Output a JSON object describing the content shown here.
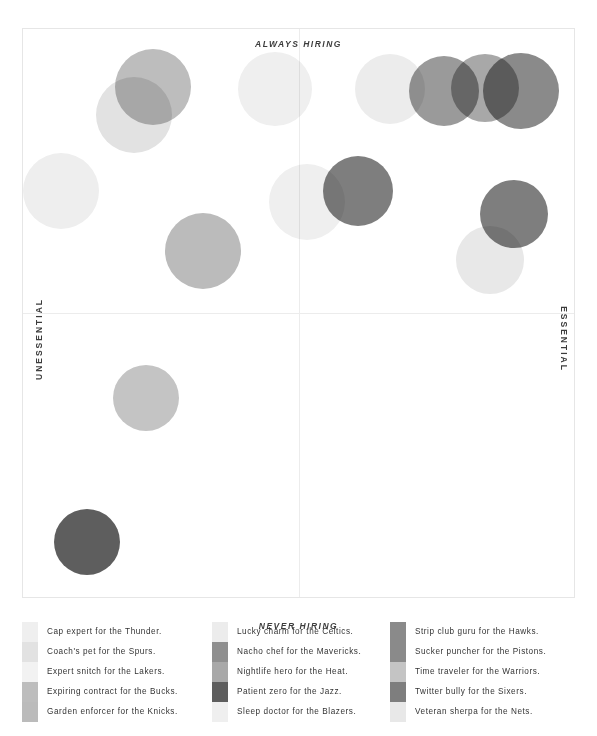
{
  "axes": {
    "top_label": "ALWAYS HIRING",
    "bottom_label": "NEVER HIRING",
    "left_label": "UNESSENTIAL",
    "right_label": "ESSENTIAL"
  },
  "chart_data": {
    "type": "scatter",
    "title": "",
    "xlabel": "UNESSENTIAL — ESSENTIAL",
    "ylabel": "NEVER HIRING — ALWAYS HIRING",
    "xlim": [
      -1,
      1
    ],
    "ylim": [
      -1,
      1
    ],
    "grid": false,
    "legend_position": "bottom",
    "axis_captions": {
      "top": "ALWAYS HIRING",
      "bottom": "NEVER HIRING",
      "left": "UNESSENTIAL",
      "right": "ESSENTIAL"
    },
    "note": "Quadrant bubble chart. x/y are plot-fraction coordinates (0..1) of bubble centers within the framed plot area; r is bubble radius in px.",
    "points": [
      {
        "label": "Cap expert for the Thunder.",
        "color": "#efefef",
        "x": 0.455,
        "y": 0.105,
        "r": 37
      },
      {
        "label": "Coach's pet for the Spurs.",
        "color": "#e2e2e2",
        "x": 0.2,
        "y": 0.15,
        "r": 38
      },
      {
        "label": "Expert snitch for the Lakers.",
        "color": "#eeeeee",
        "x": 0.068,
        "y": 0.285,
        "r": 38
      },
      {
        "label": "Expiring contract for the Bucks.",
        "color": "#bdbdbd",
        "x": 0.235,
        "y": 0.102,
        "r": 38
      },
      {
        "label": "Garden enforcer for the Knicks.",
        "color": "#bbbbbb",
        "x": 0.325,
        "y": 0.39,
        "r": 38
      },
      {
        "label": "Lucky charm for the Celtics.",
        "color": "#ececec",
        "x": 0.663,
        "y": 0.105,
        "r": 35
      },
      {
        "label": "Nacho chef for the Mavericks.",
        "color": "#9a9a9a",
        "x": 0.762,
        "y": 0.108,
        "r": 35
      },
      {
        "label": "Nightlife hero for the Heat.",
        "color": "#a8a8a8",
        "x": 0.836,
        "y": 0.104,
        "r": 34
      },
      {
        "label": "Patient zero for the Jazz.",
        "color": "#5e5e5e",
        "x": 0.115,
        "y": 0.9,
        "r": 33
      },
      {
        "label": "Sleep doctor for the Blazers.",
        "color": "#efefef",
        "x": 0.513,
        "y": 0.303,
        "r": 38
      },
      {
        "label": "Strip club guru for the Hawks.",
        "color": "#8a8a8a",
        "x": 0.901,
        "y": 0.108,
        "r": 38
      },
      {
        "label": "Sucker puncher for the Pistons.",
        "color": "#7e7e7e",
        "x": 0.605,
        "y": 0.285,
        "r": 35
      },
      {
        "label": "Time traveler for the Warriors.",
        "color": "#c4c4c4",
        "x": 0.222,
        "y": 0.648,
        "r": 33
      },
      {
        "label": "Twitter bully for the Sixers.",
        "color": "#7e7e7e",
        "x": 0.888,
        "y": 0.325,
        "r": 34
      },
      {
        "label": "Veteran sherpa for the Nets.",
        "color": "#e8e8e8",
        "x": 0.845,
        "y": 0.405,
        "r": 34
      }
    ]
  },
  "legend": {
    "columns": [
      {
        "items": [
          {
            "label": "Cap expert for the Thunder.",
            "color": "#efefef"
          },
          {
            "label": "Coach's pet for the Spurs.",
            "color": "#e2e2e2"
          },
          {
            "label": "Expert snitch for the Lakers.",
            "color": "#f2f2f2"
          },
          {
            "label": "Expiring contract for the Bucks.",
            "color": "#bdbdbd"
          },
          {
            "label": "Garden enforcer for the Knicks.",
            "color": "#bbbbbb"
          }
        ]
      },
      {
        "items": [
          {
            "label": "Lucky charm for the Celtics.",
            "color": "#ececec"
          },
          {
            "label": "Nacho chef for the Mavericks.",
            "color": "#8f8f8f"
          },
          {
            "label": "Nightlife hero for the Heat.",
            "color": "#a8a8a8"
          },
          {
            "label": "Patient zero for the Jazz.",
            "color": "#5e5e5e"
          },
          {
            "label": "Sleep doctor for the Blazers.",
            "color": "#efefef"
          }
        ]
      },
      {
        "items": [
          {
            "label": "Strip club guru for the Hawks.",
            "color": "#8a8a8a"
          },
          {
            "label": "Sucker puncher for the Pistons.",
            "color": "#8a8a8a"
          },
          {
            "label": "Time traveler for the Warriors.",
            "color": "#c4c4c4"
          },
          {
            "label": "Twitter bully for the Sixers.",
            "color": "#7e7e7e"
          },
          {
            "label": "Veteran sherpa for the Nets.",
            "color": "#e8e8e8"
          }
        ]
      }
    ]
  }
}
